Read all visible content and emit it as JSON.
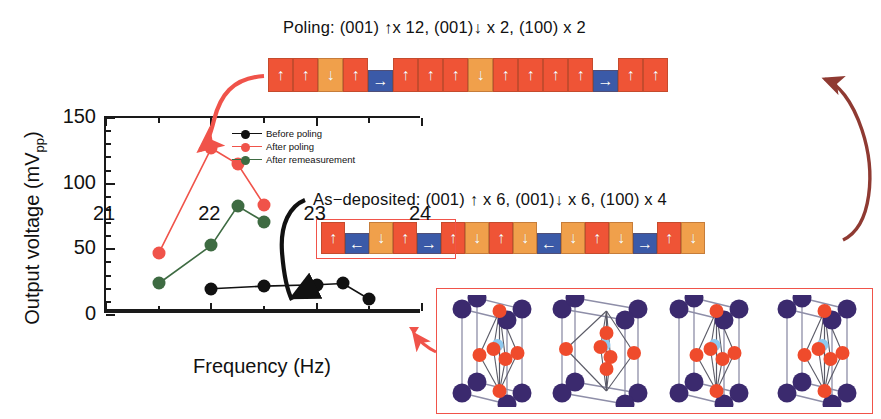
{
  "figure": {
    "poling_title": "Poling: (001) ↑x 12, (001)↓ x 2, (100) x 2",
    "asdeposited_title": "As−deposited: (001) ↑ x 6, (001)↓ x 6, (100) x 4"
  },
  "colors": {
    "red": "#f0534a",
    "green": "#3e6b42",
    "black": "#111111",
    "cell_up": "#ef5436",
    "cell_down": "#f0a04b",
    "cell_horizontal": "#3b5aa8",
    "connector_red": "#f0534a",
    "connector_dark_red": "#8f3a32",
    "atom_a_site": "#3b2a6e",
    "atom_oxygen": "#ef4b2c",
    "atom_b_site": "#8ec9ef"
  },
  "chart_data": {
    "type": "line",
    "title": "",
    "xlabel": "Frequency (Hz)",
    "ylabel": "Output voltage (mVpp)",
    "xlim": [
      21,
      24
    ],
    "ylim": [
      0,
      150
    ],
    "xticks": [
      21,
      22,
      23,
      24
    ],
    "xticklabels": [
      "21",
      "22",
      "23",
      "24"
    ],
    "xminorticks": [
      21.5,
      22.5,
      23.5
    ],
    "yticks": [
      0,
      50,
      100,
      150
    ],
    "yticklabels": [
      "0",
      "50",
      "100",
      "150"
    ],
    "yminortick_step": 10,
    "grid": false,
    "legend_position": "top-right",
    "series": [
      {
        "name": "Before poling",
        "color": "#111111",
        "x": [
          22.0,
          22.5,
          23.0,
          23.25,
          23.5
        ],
        "values": [
          20,
          22,
          23,
          24,
          12
        ]
      },
      {
        "name": "After poling",
        "color": "#f0534a",
        "x": [
          21.5,
          22.0,
          22.25,
          22.5
        ],
        "values": [
          47,
          127,
          115,
          84
        ]
      },
      {
        "name": "After remeasurement",
        "color": "#3e6b42",
        "x": [
          21.5,
          22.0,
          22.25,
          22.5
        ],
        "values": [
          24,
          53,
          83,
          71
        ]
      }
    ]
  },
  "legend": {
    "items": [
      {
        "label": "Before poling",
        "color": "#111111"
      },
      {
        "label": "After poling",
        "color": "#f0534a"
      },
      {
        "label": "After remeasurement",
        "color": "#3e6b42"
      }
    ]
  },
  "domain_strips": {
    "poling": {
      "name": "poling-domain-strip",
      "summary": "12 up, 2 down, 2 in-plane",
      "cells": [
        {
          "dir": "up"
        },
        {
          "dir": "up"
        },
        {
          "dir": "down"
        },
        {
          "dir": "up"
        },
        {
          "dir": "right"
        },
        {
          "dir": "up"
        },
        {
          "dir": "up"
        },
        {
          "dir": "up"
        },
        {
          "dir": "down"
        },
        {
          "dir": "up"
        },
        {
          "dir": "up"
        },
        {
          "dir": "up"
        },
        {
          "dir": "up"
        },
        {
          "dir": "right"
        },
        {
          "dir": "up"
        },
        {
          "dir": "up"
        }
      ]
    },
    "as_deposited": {
      "name": "as-deposited-domain-strip",
      "summary": "6 up, 6 down, 4 in-plane",
      "cells": [
        {
          "dir": "up"
        },
        {
          "dir": "left"
        },
        {
          "dir": "down"
        },
        {
          "dir": "up"
        },
        {
          "dir": "right"
        },
        {
          "dir": "up"
        },
        {
          "dir": "down"
        },
        {
          "dir": "up"
        },
        {
          "dir": "down"
        },
        {
          "dir": "left"
        },
        {
          "dir": "down"
        },
        {
          "dir": "up"
        },
        {
          "dir": "down"
        },
        {
          "dir": "right"
        },
        {
          "dir": "up"
        },
        {
          "dir": "down"
        }
      ]
    }
  },
  "arrow_glyphs": {
    "up": "↑",
    "down": "↓",
    "left": "←",
    "right": "→"
  },
  "crystal_inset": {
    "name": "perovskite-unit-cell-inset",
    "cell_count": 4,
    "variants": [
      "tetragonal-up",
      "tetragonal-in-plane",
      "tetragonal-up",
      "tetragonal-up"
    ]
  }
}
